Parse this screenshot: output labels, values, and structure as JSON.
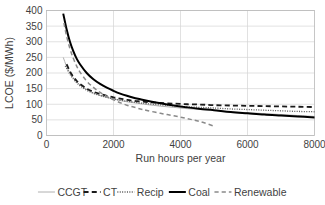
{
  "chart_data": {
    "type": "line",
    "title": "",
    "xlabel": "Run hours per year",
    "ylabel": "LCOE ($/MWh)",
    "xlim": [
      0,
      8000
    ],
    "ylim": [
      0,
      400
    ],
    "xticks": [
      0,
      2000,
      4000,
      6000,
      8000
    ],
    "yticks": [
      0,
      50,
      100,
      150,
      200,
      250,
      300,
      350,
      400
    ],
    "xtick_labels": [
      "0",
      "2000",
      "4000",
      "6000",
      "8000"
    ],
    "ytick_labels": [
      "0",
      "50",
      "100",
      "150",
      "200",
      "250",
      "300",
      "350",
      "400"
    ],
    "grid": "horizontal-and-vertical",
    "legend_position": "bottom",
    "series": [
      {
        "name": "CCGT",
        "color": "#b0b0b0",
        "style": "solid",
        "width": 1.0,
        "x": [
          500,
          600,
          700,
          800,
          900,
          1000,
          1200,
          1400,
          1600,
          1800,
          2000,
          2200,
          2400,
          2600,
          2800,
          3000,
          3400,
          3800,
          4200,
          4600,
          5000,
          5500,
          6000,
          6500,
          7000,
          7500,
          8000
        ],
        "y": [
          250,
          221,
          200,
          185,
          172,
          162,
          147,
          136,
          128,
          122,
          117,
          112,
          108,
          105,
          102,
          99,
          94,
          90,
          86,
          83,
          80,
          76,
          73,
          70,
          67,
          64,
          61
        ]
      },
      {
        "name": "CT",
        "color": "#1a1a1a",
        "style": "dashed",
        "width": 1.8,
        "x": [
          600,
          700,
          800,
          900,
          1000,
          1200,
          1400,
          1600,
          1800,
          2000,
          2200,
          2400,
          2600,
          2800,
          3000,
          3400,
          3800,
          4200,
          4600,
          5000,
          5500,
          6000,
          6500,
          7000,
          7500,
          8000
        ],
        "y": [
          228,
          205,
          188,
          175,
          165,
          150,
          140,
          133,
          127,
          122,
          118,
          114,
          111,
          109,
          107,
          104,
          102,
          100,
          99,
          97,
          96,
          95,
          94,
          93,
          92,
          91
        ]
      },
      {
        "name": "Recip",
        "color": "#555555",
        "style": "dotted",
        "width": 1.3,
        "x": [
          560,
          700,
          800,
          900,
          1000,
          1200,
          1400,
          1600,
          1800,
          2000,
          2200,
          2400,
          2600,
          2800,
          3000,
          3400,
          3800,
          4200,
          4600,
          5000,
          5500,
          6000,
          6500,
          7000,
          7500,
          8000
        ],
        "y": [
          222,
          196,
          181,
          169,
          159,
          145,
          135,
          128,
          122,
          117,
          113,
          110,
          107,
          104,
          102,
          98,
          95,
          92,
          90,
          88,
          85,
          83,
          81,
          79,
          77,
          76
        ]
      },
      {
        "name": "Coal",
        "color": "#000000",
        "style": "solid",
        "width": 2.0,
        "x": [
          500,
          600,
          700,
          800,
          900,
          1000,
          1200,
          1400,
          1600,
          1800,
          2000,
          2200,
          2400,
          2600,
          2800,
          3000,
          3400,
          3800,
          4200,
          4600,
          5000,
          5500,
          6000,
          6500,
          7000,
          7500,
          8000
        ],
        "y": [
          390,
          340,
          300,
          270,
          246,
          228,
          200,
          180,
          165,
          153,
          143,
          134,
          127,
          121,
          116,
          111,
          103,
          96,
          90,
          85,
          81,
          75,
          71,
          67,
          64,
          61,
          58
        ]
      },
      {
        "name": "Renewable",
        "color": "#8a8a8a",
        "style": "dashed",
        "width": 1.5,
        "x": [
          520,
          600,
          700,
          800,
          900,
          1000,
          1200,
          1400,
          1600,
          1800,
          2000,
          2200,
          2400,
          2600,
          2800,
          3000,
          3400,
          3800,
          4200,
          4600,
          5000
        ],
        "y": [
          360,
          318,
          278,
          247,
          222,
          203,
          174,
          154,
          138,
          125,
          114,
          105,
          97,
          91,
          85,
          80,
          71,
          63,
          54,
          44,
          30
        ]
      }
    ]
  },
  "legend": {
    "items": [
      {
        "label": "CCGT"
      },
      {
        "label": "CT"
      },
      {
        "label": "Recip"
      },
      {
        "label": "Coal"
      },
      {
        "label": "Renewable"
      }
    ]
  }
}
